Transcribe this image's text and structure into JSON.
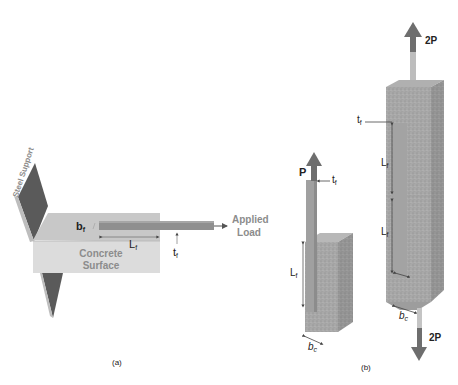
{
  "panel_a": {
    "caption": "(a)",
    "steel_support_label": "Steel Support",
    "concrete_label_line1": "Concrete",
    "concrete_label_line2": "Surface",
    "applied_load_line1": "Applied",
    "applied_load_line2": "Load",
    "bf_main": "b",
    "bf_sub": "f",
    "lf_main": "L",
    "lf_sub": "f",
    "tf_main": "t",
    "tf_sub": "f"
  },
  "panel_b": {
    "caption": "(b)",
    "single_shear": {
      "load_label": "P",
      "tf_main": "t",
      "tf_sub": "f",
      "lf_main": "L",
      "lf_sub": "f",
      "bc_main": "b",
      "bc_sub": "c"
    },
    "double_shear": {
      "top_load_label": "2P",
      "bottom_load_label": "2P",
      "tf_main": "t",
      "tf_sub": "f",
      "lf_upper_main": "L",
      "lf_upper_sub": "f",
      "lf_lower_main": "L",
      "lf_lower_sub": "f",
      "bc_main": "b",
      "bc_sub": "c"
    }
  },
  "colors": {
    "steel": "#5a5a5a",
    "concrete_top": "#c9c9c9",
    "concrete_front": "#d6d6d6",
    "frp": "#9a9a9a",
    "label_grey": "#8c8c8c",
    "arrow": "#6e6e6e"
  }
}
